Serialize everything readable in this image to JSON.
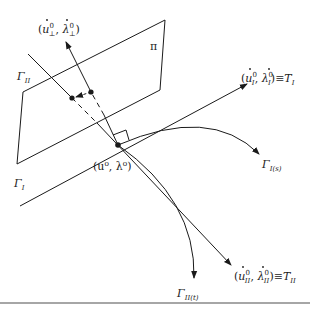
{
  "diagram": {
    "plane_label": "π",
    "point_label": "(u⁰, λ⁰)",
    "curves": {
      "gamma_I_label": "Γ",
      "gamma_I_sub": "I",
      "gamma_II_label": "Γ",
      "gamma_II_sub": "II",
      "gamma_I_s_label": "Γ",
      "gamma_I_s_sub": "I(s)",
      "gamma_II_t_label": "Γ",
      "gamma_II_t_sub": "II(t)"
    },
    "vectors": {
      "perp": {
        "open": "(",
        "u": "u",
        "u_sup": "0",
        "u_sub": "⊥",
        "sep": ", ",
        "lam": "λ",
        "lam_sup": "0",
        "lam_sub": "⊥",
        "close": ")"
      },
      "tangent_I": {
        "open": "(",
        "u": "u",
        "u_sup": "0",
        "u_sub": "I",
        "sep": ", ",
        "lam": "λ",
        "lam_sup": "0",
        "lam_sub": "I",
        "close": ")≡",
        "T": "T",
        "T_sub": "I"
      },
      "tangent_II": {
        "open": "(",
        "u": "u",
        "u_sup": "0",
        "u_sub": "II",
        "sep": ", ",
        "lam": "λ",
        "lam_sup": "0",
        "lam_sub": "II",
        "close": ")≡",
        "T": "T",
        "T_sub": "II"
      }
    },
    "colors": {
      "stroke": "#1a1a1a",
      "rule": "#888888"
    }
  }
}
